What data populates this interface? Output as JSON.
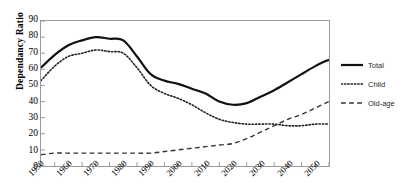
{
  "chart_data": {
    "type": "line",
    "title": "",
    "xlabel": "",
    "ylabel": "Dependancy Ratio",
    "xlim": [
      1950,
      2055
    ],
    "ylim": [
      0,
      90
    ],
    "ytick_step": 10,
    "xtick_step": 5,
    "xlabel_step": 10,
    "grid": false,
    "legend_position": "right",
    "yticks": [
      90,
      80,
      70,
      60,
      50,
      40,
      30,
      20,
      10,
      0
    ],
    "xticks": [
      1950,
      1955,
      1960,
      1965,
      1970,
      1975,
      1980,
      1985,
      1990,
      1995,
      2000,
      2005,
      2010,
      2015,
      2020,
      2025,
      2030,
      2035,
      2040,
      2045,
      2050,
      2055
    ],
    "xticklabels": [
      "1950",
      "1960",
      "1970",
      "1980",
      "1990",
      "2000",
      "2010",
      "2020",
      "2030",
      "2040",
      "2050"
    ],
    "xticklabel_years": [
      1950,
      1960,
      1970,
      1980,
      1990,
      2000,
      2010,
      2020,
      2030,
      2040,
      2050
    ],
    "x": [
      1950,
      1955,
      1960,
      1965,
      1970,
      1975,
      1980,
      1985,
      1990,
      1995,
      2000,
      2005,
      2010,
      2015,
      2020,
      2025,
      2030,
      2035,
      2040,
      2045,
      2050,
      2055
    ],
    "series": [
      {
        "name": "Total",
        "style": "solid",
        "color": "#111111",
        "width": 2.2,
        "values": [
          61,
          69,
          75,
          78,
          80,
          79,
          78,
          68,
          57,
          53,
          51,
          48,
          45,
          40,
          38,
          39,
          43,
          47,
          52,
          57,
          62,
          66
        ]
      },
      {
        "name": "Child",
        "style": "dotted",
        "color": "#222222",
        "width": 1.6,
        "values": [
          53,
          62,
          68,
          70,
          72,
          71,
          70,
          61,
          50,
          45,
          42,
          38,
          33,
          29,
          27,
          26,
          26,
          26,
          25,
          25,
          26,
          26
        ]
      },
      {
        "name": "Old-age",
        "style": "dashed",
        "color": "#333333",
        "width": 1.4,
        "values": [
          7,
          8,
          8,
          8,
          8,
          8,
          8,
          8,
          8,
          9,
          10,
          11,
          12,
          13,
          14,
          17,
          21,
          25,
          29,
          32,
          36,
          40
        ]
      }
    ]
  },
  "legend": {
    "items": [
      {
        "label": "Total",
        "style": "solid"
      },
      {
        "label": "Child",
        "style": "dotted"
      },
      {
        "label": "Old-age",
        "style": "dashed"
      }
    ]
  },
  "axis": {
    "y_title": "Dependancy Ratio"
  }
}
